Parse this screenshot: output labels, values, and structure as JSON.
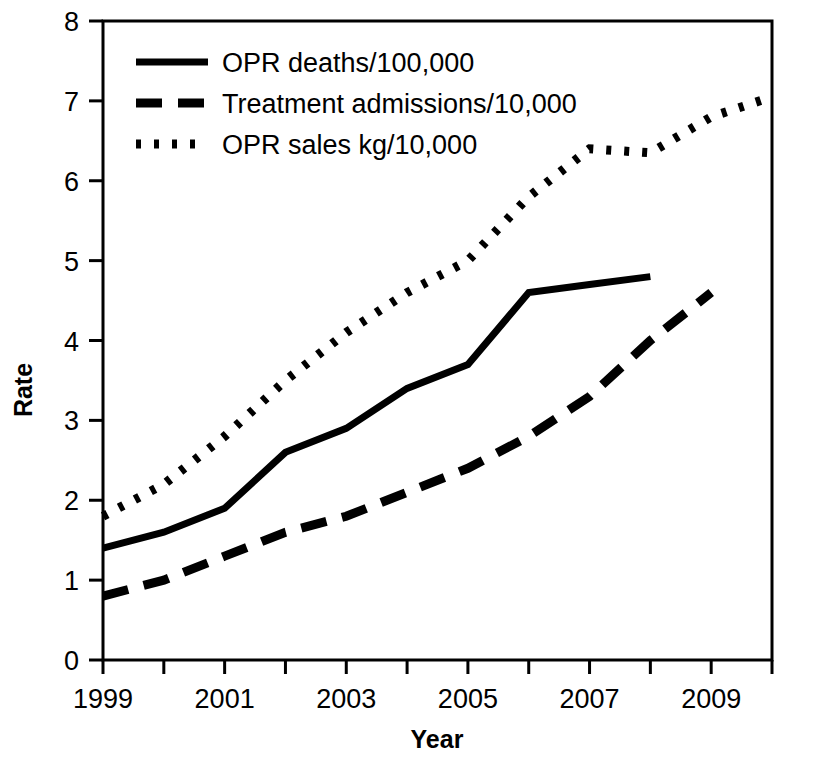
{
  "chart_data": {
    "type": "line",
    "title": "",
    "xlabel": "Year",
    "ylabel": "Rate",
    "xlim": [
      1999,
      2010
    ],
    "ylim": [
      0,
      8
    ],
    "grid": false,
    "legend_position": "top-left",
    "x": [
      1999,
      2000,
      2001,
      2002,
      2003,
      2004,
      2005,
      2006,
      2007,
      2008,
      2009,
      2010
    ],
    "xticklabels": [
      "1999",
      "",
      "2001",
      "",
      "2003",
      "",
      "2005",
      "",
      "2007",
      "",
      "2009",
      ""
    ],
    "xtick_values": [
      1999,
      2000,
      2001,
      2002,
      2003,
      2004,
      2005,
      2006,
      2007,
      2008,
      2009,
      2010
    ],
    "xtick_labeled": [
      "1999",
      "2001",
      "2003",
      "2005",
      "2007",
      "2009"
    ],
    "yticklabels": [
      "0",
      "1",
      "2",
      "3",
      "4",
      "5",
      "6",
      "7",
      "8"
    ],
    "ytick_values": [
      0,
      1,
      2,
      3,
      4,
      5,
      6,
      7,
      8
    ],
    "series": [
      {
        "name": "OPR deaths/100,000",
        "style": "solid",
        "color": "#000000",
        "x": [
          1999,
          2000,
          2001,
          2002,
          2003,
          2004,
          2005,
          2006,
          2007,
          2008
        ],
        "values": [
          1.4,
          1.6,
          1.9,
          2.6,
          2.9,
          3.4,
          3.7,
          4.6,
          4.7,
          4.8
        ]
      },
      {
        "name": "Treatment admissions/10,000",
        "style": "dashed",
        "color": "#000000",
        "x": [
          1999,
          2000,
          2001,
          2002,
          2003,
          2004,
          2005,
          2006,
          2007,
          2008,
          2009
        ],
        "values": [
          0.8,
          1.0,
          1.3,
          1.6,
          1.8,
          2.1,
          2.4,
          2.8,
          3.3,
          4.0,
          4.6
        ]
      },
      {
        "name": "OPR sales kg/10,000",
        "style": "dotted",
        "color": "#000000",
        "x": [
          1999,
          2000,
          2001,
          2002,
          2003,
          2004,
          2005,
          2006,
          2007,
          2008,
          2009,
          2010
        ],
        "values": [
          1.8,
          2.2,
          2.8,
          3.5,
          4.1,
          4.6,
          5.0,
          5.8,
          6.4,
          6.35,
          6.8,
          7.05
        ]
      }
    ]
  },
  "legend": {
    "items": [
      {
        "label": "OPR deaths/100,000",
        "style": "solid"
      },
      {
        "label": "Treatment admissions/10,000",
        "style": "dashed"
      },
      {
        "label": "OPR sales kg/10,000",
        "style": "dotted"
      }
    ]
  },
  "axes": {
    "x_title": "Year",
    "y_title": "Rate"
  }
}
